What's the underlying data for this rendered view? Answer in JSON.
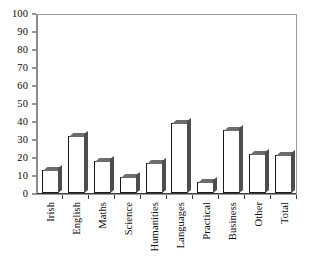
{
  "chart_data": {
    "type": "bar",
    "title": "",
    "subtitle": "",
    "xlabel": "",
    "ylabel": "",
    "ylim": [
      0,
      100
    ],
    "ytick_step": 10,
    "grid": false,
    "legend": false,
    "legend_position": "none",
    "categories": [
      "Irish",
      "English",
      "Maths",
      "Science",
      "Humanities",
      "Languages",
      "Practical",
      "Business",
      "Other",
      "Total"
    ],
    "values": [
      13,
      32,
      18,
      9,
      17,
      39,
      6,
      35,
      22,
      21
    ],
    "ytick_labels": [
      "0",
      "10",
      "20",
      "30",
      "40",
      "50",
      "60",
      "70",
      "80",
      "90",
      "100"
    ],
    "series": [
      {
        "name": "",
        "values": [
          13,
          32,
          18,
          9,
          17,
          39,
          6,
          35,
          22,
          21
        ]
      }
    ],
    "style": {
      "bar_face_color": "#ffffff",
      "bar_edge_color": "#1a1a1a",
      "bar_shadow_color": "#4d4d4d",
      "bar_top_color": "#6d6d6d",
      "axis_color": "#3a3a3a",
      "frame_color": "#9a9a9a",
      "text_color": "#0a0a0a",
      "background_color": "#ffffff"
    }
  }
}
